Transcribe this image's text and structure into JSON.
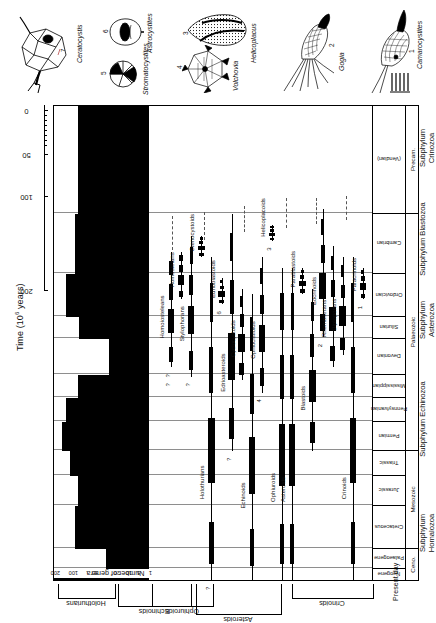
{
  "figure": {
    "title_prefix": "Time (10",
    "title_exp": "6",
    "title_suffix": " years)",
    "present_day_label": "Present day",
    "genera_axis_title": "Number of genera"
  },
  "time_axis": {
    "label": "Time (10⁶ years)",
    "ticks": [
      {
        "value": "200",
        "pos": 0
      },
      {
        "value": "100",
        "pos": 94
      },
      {
        "value": "50",
        "pos": 136
      },
      {
        "value": "0",
        "pos": 180
      }
    ]
  },
  "genera_axis": {
    "title": "Number of genera",
    "ticks": [
      "200",
      "100",
      "50",
      "20",
      "10",
      "5",
      "1"
    ]
  },
  "timescale": {
    "periods": [
      {
        "name": "Neogene",
        "width": 12
      },
      {
        "name": "Palaeogene",
        "width": 20
      },
      {
        "name": "Cretaceous",
        "width": 43
      },
      {
        "name": "Jurassic",
        "width": 30
      },
      {
        "name": "Triassic",
        "width": 25
      },
      {
        "name": "Permian",
        "width": 29
      },
      {
        "name": "Pennsylvanian",
        "width": 24
      },
      {
        "name": "Mississippian",
        "width": 23
      },
      {
        "name": "Devonian",
        "width": 36
      },
      {
        "name": "Silurian",
        "width": 22
      },
      {
        "name": "Ordovician",
        "width": 43
      },
      {
        "name": "Cambrian",
        "width": 60
      },
      {
        "name": "(Vendian)",
        "width": 108
      }
    ],
    "eras": [
      {
        "name": "Ceno.",
        "width": 32
      },
      {
        "name": "Mesozoic",
        "width": 98
      },
      {
        "name": "Palaeozoic",
        "width": 237
      },
      {
        "name": "Precam.",
        "width": 108
      }
    ]
  },
  "class_brackets": [
    {
      "label": "Holothurians"
    },
    {
      "label": "Echinoids"
    },
    {
      "label": "Asteroids"
    },
    {
      "label": "Ophiuroids"
    },
    {
      "label": "Crinoids"
    }
  ],
  "subphyla": [
    {
      "line1": "Subphylum",
      "line2": "Homalozoa"
    },
    {
      "line1": "Subphylum Echinozoa",
      "line2": ""
    },
    {
      "line1": "Subphylum",
      "line2": "Asterozoa"
    },
    {
      "line1": "Subphylum Blastozoa",
      "line2": ""
    },
    {
      "line1": "Subphylum",
      "line2": "Crinozoa"
    }
  ],
  "groups": [
    {
      "name": "Homoiosteleans",
      "marks": [
        "?",
        "?"
      ]
    },
    {
      "name": "Homostelans",
      "marks": []
    },
    {
      "name": "Stylophorans",
      "marks": [
        "?"
      ]
    },
    {
      "name": "Ctenocystoids",
      "marks": []
    },
    {
      "name": "Holothurians",
      "marks": [
        "?"
      ]
    },
    {
      "name": "Edrioblastoids",
      "marks": [
        "6"
      ]
    },
    {
      "name": "Edrioasteroids",
      "marks": [
        "?"
      ]
    },
    {
      "name": "Cyclocystoids",
      "marks": []
    },
    {
      "name": "Echinoids",
      "marks": []
    },
    {
      "name": "Ophiocistioids",
      "marks": [
        "4"
      ]
    },
    {
      "name": "Helicoplacoids",
      "marks": [
        "3"
      ]
    },
    {
      "name": "Ophiuroids",
      "marks": []
    },
    {
      "name": "Asteroids",
      "marks": []
    },
    {
      "name": "Parablastoids",
      "marks": []
    },
    {
      "name": "Blastoids",
      "marks": []
    },
    {
      "name": "Eocrinoids",
      "marks": [
        "2"
      ]
    },
    {
      "name": "Rhombiferans",
      "marks": []
    },
    {
      "name": "Diploporans",
      "marks": []
    },
    {
      "name": "Crinoids",
      "marks": []
    },
    {
      "name": "Paracrinoids",
      "marks": [
        "1"
      ]
    }
  ],
  "illustrations": [
    {
      "number": "7",
      "name": "Ceratocystis"
    },
    {
      "number": "5",
      "name": "Stromatocystites"
    },
    {
      "number": "6",
      "name": "Astrocystites"
    },
    {
      "number": "4",
      "name": "Volchovia"
    },
    {
      "number": "3",
      "name": "Helicoplacus"
    },
    {
      "number": "2",
      "name": "Gogia"
    },
    {
      "number": "1",
      "name": "Camarocystites"
    }
  ],
  "chart_data": {
    "type": "area",
    "xlabel": "Time (10⁶ years)",
    "ylabel": "Number of genera",
    "xlim": [
      600,
      0
    ],
    "ylim": [
      1,
      250
    ],
    "yscale": "log",
    "grid": true,
    "legend": "none",
    "y_ticks": [
      1,
      5,
      10,
      20,
      50,
      100,
      200
    ],
    "x_ticks": [
      200,
      100,
      50,
      0
    ],
    "categories": [
      "(Vendian)",
      "Cambrian",
      "Ordovician",
      "Silurian",
      "Devonian",
      "Mississippian",
      "Pennsylvanian",
      "Permian",
      "Triassic",
      "Jurassic",
      "Cretaceous",
      "Palaeogene",
      "Neogene"
    ],
    "series": [
      {
        "name": "Crinoids",
        "values": [
          0,
          12,
          70,
          60,
          95,
          150,
          120,
          60,
          10,
          45,
          60,
          30,
          25
        ]
      },
      {
        "name": "Ophiuroids",
        "values": [
          0,
          2,
          12,
          10,
          14,
          9,
          7,
          5,
          4,
          12,
          14,
          12,
          18
        ]
      },
      {
        "name": "Asteroids",
        "values": [
          0,
          2,
          14,
          10,
          16,
          10,
          6,
          4,
          5,
          14,
          18,
          16,
          22
        ]
      },
      {
        "name": "Echinoids",
        "values": [
          0,
          0,
          6,
          5,
          9,
          20,
          18,
          12,
          6,
          55,
          120,
          70,
          60
        ]
      },
      {
        "name": "Holothurians",
        "values": [
          0,
          0,
          2,
          2,
          4,
          6,
          5,
          4,
          3,
          6,
          7,
          6,
          8
        ]
      }
    ],
    "range_bars": [
      {
        "group": "Homoiosteleans",
        "start": 505,
        "end": 370
      },
      {
        "group": "Homostelans",
        "start": 505,
        "end": 460
      },
      {
        "group": "Stylophorans",
        "start": 520,
        "end": 355
      },
      {
        "group": "Ctenocystoids",
        "start": 520,
        "end": 500
      },
      {
        "group": "Holothurians",
        "start": 500,
        "end": 0
      },
      {
        "group": "Edrioblastoids",
        "start": 480,
        "end": 455
      },
      {
        "group": "Edrioasteroids",
        "start": 540,
        "end": 250
      },
      {
        "group": "Cyclocystoids",
        "start": 470,
        "end": 350
      },
      {
        "group": "Echinoids",
        "start": 465,
        "end": 0
      },
      {
        "group": "Ophiocistioids",
        "start": 500,
        "end": 330
      },
      {
        "group": "Helicoplacoids",
        "start": 530,
        "end": 515
      },
      {
        "group": "Ophiuroids",
        "start": 490,
        "end": 0
      },
      {
        "group": "Asteroids",
        "start": 490,
        "end": 0
      },
      {
        "group": "Parablastoids",
        "start": 490,
        "end": 465
      },
      {
        "group": "Blastoids",
        "start": 470,
        "end": 250
      },
      {
        "group": "Eocrinoids",
        "start": 545,
        "end": 420
      },
      {
        "group": "Rhombiferans",
        "start": 510,
        "end": 370
      },
      {
        "group": "Diploporans",
        "start": 500,
        "end": 390
      },
      {
        "group": "Crinoids",
        "start": 500,
        "end": 0
      },
      {
        "group": "Paracrinoids",
        "start": 490,
        "end": 460
      }
    ]
  }
}
